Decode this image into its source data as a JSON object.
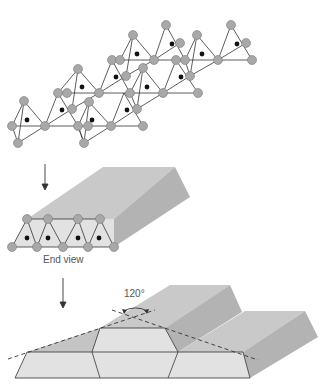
{
  "labels": {
    "end_view": "End view",
    "angle": "120°"
  },
  "colors": {
    "atom_fill": "#a8a8a8",
    "atom_stroke": "#7a7a7a",
    "bond": "#333333",
    "center_dot": "#111111",
    "prism_top": "#c8c8c8",
    "prism_side": "#b4b4b4",
    "prism_front": "#e0e0e0",
    "outline": "#333333"
  },
  "panels": [
    {
      "id": "chain-network",
      "description": "Sheet of linked tetrahedral units with grey atoms and central black dots"
    },
    {
      "id": "single-prism",
      "description": "Extended prism with end view showing triangular units"
    },
    {
      "id": "stacked-prisms",
      "description": "Stacked prisms with dashed lines forming 120° angle"
    }
  ]
}
